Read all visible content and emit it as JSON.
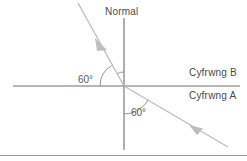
{
  "diagram": {
    "title_label": "Normal",
    "medium_upper_label": "Cyfrwng B",
    "medium_lower_label": "Cyfrwng A",
    "angle_reflection_label": "60°",
    "angle_incidence_label": "60°",
    "colors": {
      "interface_line": "#6e6e6e",
      "normal_line": "#6e6e6e",
      "ray_line": "#b8b8b8",
      "text": "#4a4a4a",
      "arc": "#8a8a8a",
      "footer_rule": "#9a9a9a",
      "background": "#ffffff"
    },
    "geometry": {
      "origin_x": 124,
      "origin_y": 86,
      "interface_x_start": 13,
      "interface_x_end": 240,
      "normal_y_top": 18,
      "normal_y_bottom": 150,
      "reflected_ray_tip_x": 78,
      "reflected_ray_tip_y": 3,
      "incident_ray_tail_x": 228,
      "incident_ray_tail_y": 147,
      "incident_arrow_x": 196,
      "incident_arrow_y": 129,
      "reflected_arrow_x": 101,
      "reflected_arrow_y": 46
    }
  }
}
